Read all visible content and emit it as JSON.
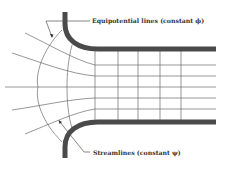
{
  "diagram": {
    "labels": {
      "equipotential": "Equipotential lines (constant ϕ)",
      "streamlines": "Streamlines (constant ψ)"
    },
    "colors": {
      "wall": "#4a4a4a",
      "grid": "#6a6a6a",
      "text": "#333333",
      "background": "#ffffff"
    }
  }
}
